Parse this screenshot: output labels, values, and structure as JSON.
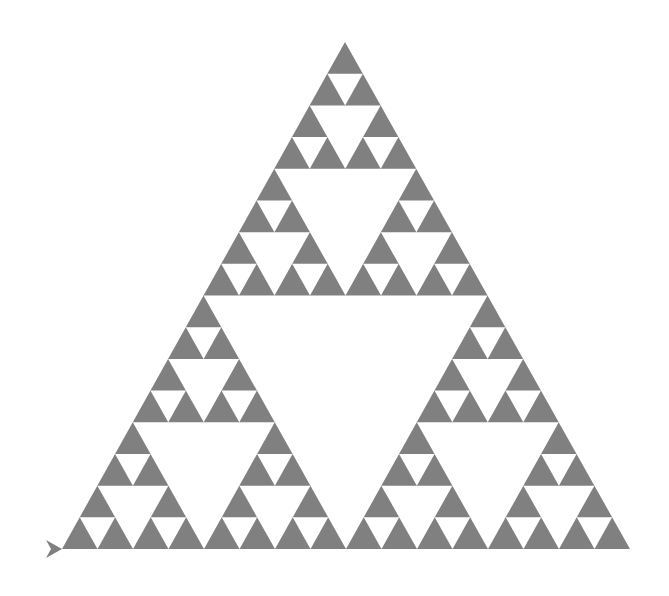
{
  "figure": {
    "type": "fractal",
    "depth": 4,
    "fill_color": "#808080",
    "hole_color": "#ffffff",
    "background": "#ffffff",
    "outer_triangle": {
      "apex": [
        345,
        42
      ],
      "base_left": [
        62,
        549
      ],
      "base_right": [
        630,
        549
      ]
    },
    "turtle_cursor": {
      "tip": [
        62,
        549
      ],
      "color": "#808080",
      "heading": "right"
    }
  }
}
